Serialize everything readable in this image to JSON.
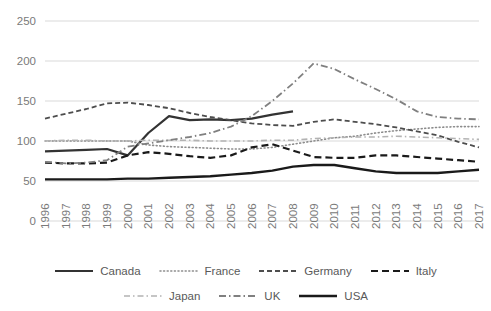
{
  "chart_data": {
    "type": "line",
    "title": "",
    "xlabel": "",
    "ylabel": "",
    "ylim": [
      0,
      250
    ],
    "yticks": [
      0,
      50,
      100,
      150,
      200,
      250
    ],
    "grid": true,
    "legend_position": "bottom",
    "categories": [
      "1996",
      "1997",
      "1998",
      "1999",
      "2000",
      "2001",
      "2002",
      "2003",
      "2004",
      "2005",
      "2006",
      "2007",
      "2008",
      "2009",
      "2010",
      "2011",
      "2012",
      "2013",
      "2014",
      "2015",
      "2016",
      "2017"
    ],
    "series": [
      {
        "name": "Canada",
        "style": "solid",
        "color": "#333333",
        "width": 2.2,
        "values": [
          87,
          88,
          89,
          90,
          82,
          110,
          131,
          126,
          127,
          126,
          128,
          133,
          137,
          null,
          null,
          null,
          null,
          null,
          null,
          null,
          null,
          null
        ]
      },
      {
        "name": "France",
        "style": "dotted",
        "color": "#8c8c8c",
        "width": 1.6,
        "values": [
          100,
          100,
          100,
          100,
          100,
          95,
          93,
          92,
          91,
          90,
          90,
          92,
          96,
          100,
          104,
          106,
          110,
          113,
          115,
          117,
          118,
          118
        ]
      },
      {
        "name": "Germany",
        "style": "dashed",
        "color": "#4d4d4d",
        "width": 1.8,
        "values": [
          128,
          134,
          140,
          147,
          148,
          145,
          141,
          135,
          130,
          126,
          122,
          120,
          119,
          124,
          127,
          124,
          121,
          117,
          112,
          107,
          99,
          92
        ]
      },
      {
        "name": "Italy",
        "style": "dashed-bold",
        "color": "#1a1a1a",
        "width": 2.2,
        "values": [
          73,
          72,
          72,
          73,
          82,
          86,
          84,
          81,
          79,
          82,
          92,
          96,
          88,
          80,
          79,
          79,
          82,
          82,
          80,
          78,
          76,
          74
        ]
      },
      {
        "name": "Japan",
        "style": "dash-dot-light",
        "color": "#b3b3b3",
        "width": 1.6,
        "values": [
          100,
          101,
          101,
          100,
          100,
          101,
          101,
          101,
          100,
          100,
          100,
          101,
          101,
          103,
          104,
          105,
          105,
          106,
          105,
          104,
          103,
          102
        ]
      },
      {
        "name": "UK",
        "style": "dash-dot",
        "color": "#808080",
        "width": 1.8,
        "values": [
          74,
          72,
          73,
          76,
          93,
          97,
          101,
          105,
          110,
          118,
          131,
          150,
          172,
          197,
          190,
          177,
          165,
          152,
          137,
          130,
          128,
          127
        ]
      },
      {
        "name": "USA",
        "style": "solid",
        "color": "#1a1a1a",
        "width": 2.4,
        "values": [
          52,
          52,
          52,
          52,
          53,
          53,
          54,
          55,
          56,
          58,
          60,
          63,
          68,
          70,
          70,
          66,
          62,
          60,
          60,
          60,
          62,
          64
        ]
      }
    ]
  },
  "legend": {
    "rows": [
      [
        "Canada",
        "France",
        "Germany",
        "Italy"
      ],
      [
        "Japan",
        "UK",
        "USA"
      ]
    ]
  }
}
